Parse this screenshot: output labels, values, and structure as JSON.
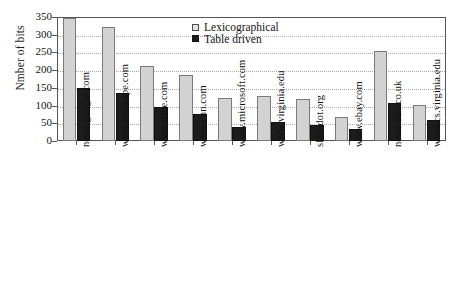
{
  "chart_data": {
    "type": "bar",
    "title": "",
    "xlabel": "",
    "ylabel": "Nmber of bits",
    "ylim": [
      0,
      350
    ],
    "yticks": [
      0,
      50,
      100,
      150,
      200,
      250,
      300,
      350
    ],
    "grid": true,
    "legend_position": "top-center",
    "categories": [
      "news.google.com",
      "www.netscape.com",
      "www.time.com",
      "www.cnn.com",
      "www.microsoft.com",
      "www.virginia.edu",
      "slashdot.org",
      "www.ebay.com",
      "news.bbc.co.uk",
      "www.cs.virginia.edu"
    ],
    "series": [
      {
        "name": "Lexicographical",
        "color": "#d2d2d2",
        "values": [
          347,
          322,
          213,
          185,
          122,
          128,
          118,
          68,
          253,
          103
        ]
      },
      {
        "name": "Table driven",
        "color": "#1c1c1c",
        "values": [
          150,
          136,
          97,
          77,
          40,
          55,
          45,
          35,
          107,
          60
        ]
      }
    ]
  },
  "axis": {
    "y_title": "Nmber of bits",
    "y_tick_labels": [
      "350",
      "300",
      "250",
      "200",
      "150",
      "100",
      "50",
      "0"
    ]
  },
  "legend": {
    "items": [
      {
        "label": "Lexicographical",
        "swatch": "light-square-swatch"
      },
      {
        "label": "Table driven",
        "swatch": "dark-square-swatch"
      }
    ]
  }
}
